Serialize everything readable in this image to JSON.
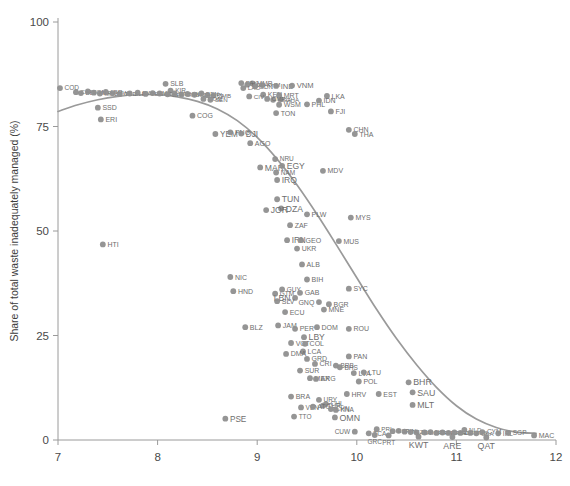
{
  "chart_data": {
    "type": "scatter",
    "title": "",
    "xlabel": "",
    "ylabel": "Share of total waste inadequately managed (%)",
    "xlim": [
      7,
      12
    ],
    "ylim": [
      0,
      100
    ],
    "xticks": [
      7,
      8,
      9,
      10,
      11,
      12
    ],
    "yticks": [
      0,
      25,
      50,
      75,
      100
    ],
    "xticklabels": [
      "7",
      "8",
      "9",
      "10",
      "11",
      "12"
    ],
    "yticklabels": [
      "0",
      "25",
      "50",
      "75",
      "100"
    ],
    "grid": false,
    "legend": null,
    "point_color": "#8f8f8f",
    "label_color": "#6e6e6e",
    "trendline": {
      "name": "fitted curve",
      "color": "#9a9a9a",
      "x": [
        7.0,
        7.2,
        7.4,
        7.6,
        7.8,
        8.0,
        8.2,
        8.4,
        8.6,
        8.8,
        9.0,
        9.2,
        9.4,
        9.6,
        9.8,
        10.0,
        10.2,
        10.4,
        10.6,
        10.8,
        11.0,
        11.2,
        11.4,
        11.6,
        11.8
      ],
      "y": [
        78.6,
        80.2,
        81.4,
        82.2,
        82.6,
        82.6,
        82.1,
        81.0,
        79.2,
        76.4,
        72.4,
        67.2,
        61.0,
        54.0,
        46.5,
        38.8,
        31.2,
        24.2,
        18.0,
        12.6,
        8.2,
        5.0,
        3.0,
        1.9,
        1.6
      ]
    },
    "points": [
      {
        "code": "COD",
        "x": 7.02,
        "y": 84.2,
        "lp": "r",
        "fs": 6.5
      },
      {
        "code": "CAF",
        "x": 7.18,
        "y": 83.2,
        "lp": "r",
        "fs": 6.2
      },
      {
        "code": "BDI",
        "x": 7.23,
        "y": 83.0,
        "lp": "r",
        "fs": 6.2
      },
      {
        "code": "SOM",
        "x": 7.3,
        "y": 83.4,
        "lp": "r",
        "fs": 6.2
      },
      {
        "code": "NER",
        "x": 7.36,
        "y": 83.1,
        "lp": "r",
        "fs": 6.2
      },
      {
        "code": "MOZ",
        "x": 7.42,
        "y": 82.9,
        "lp": "r",
        "fs": 6.2
      },
      {
        "code": "LBR",
        "x": 7.48,
        "y": 83.3,
        "lp": "r",
        "fs": 6.2
      },
      {
        "code": "MWI",
        "x": 7.55,
        "y": 83.0,
        "lp": "r",
        "fs": 6.2
      },
      {
        "code": "TCD",
        "x": 7.62,
        "y": 82.8,
        "lp": "r",
        "fs": 6.2
      },
      {
        "code": "SSD",
        "x": 7.4,
        "y": 79.5,
        "lp": "r",
        "fs": 7.0
      },
      {
        "code": "ERI",
        "x": 7.43,
        "y": 76.7,
        "lp": "r",
        "fs": 7.0
      },
      {
        "code": "HTI",
        "x": 7.45,
        "y": 46.8,
        "lp": "r",
        "fs": 7.0
      },
      {
        "code": "SLE",
        "x": 7.72,
        "y": 82.9,
        "lp": "r",
        "fs": 6.2
      },
      {
        "code": "RWA",
        "x": 7.8,
        "y": 83.1,
        "lp": "r",
        "fs": 6.2
      },
      {
        "code": "TGO",
        "x": 7.88,
        "y": 82.8,
        "lp": "r",
        "fs": 6.2
      },
      {
        "code": "GMB",
        "x": 7.95,
        "y": 83.0,
        "lp": "r",
        "fs": 6.2
      },
      {
        "code": "SLB",
        "x": 8.08,
        "y": 85.2,
        "lp": "r",
        "fs": 7.0
      },
      {
        "code": "KIR",
        "x": 8.13,
        "y": 83.6,
        "lp": "r",
        "fs": 6.5
      },
      {
        "code": "UGA",
        "x": 8.02,
        "y": 82.9,
        "lp": "r",
        "fs": 6.2
      },
      {
        "code": "BFA",
        "x": 8.1,
        "y": 82.7,
        "lp": "r",
        "fs": 6.2
      },
      {
        "code": "ETH",
        "x": 8.17,
        "y": 82.9,
        "lp": "r",
        "fs": 6.2
      },
      {
        "code": "GNB",
        "x": 8.24,
        "y": 82.7,
        "lp": "r",
        "fs": 6.2
      },
      {
        "code": "MLI",
        "x": 8.3,
        "y": 82.8,
        "lp": "r",
        "fs": 6.2
      },
      {
        "code": "TZA",
        "x": 8.37,
        "y": 82.6,
        "lp": "r",
        "fs": 6.2
      },
      {
        "code": "BEN",
        "x": 8.44,
        "y": 82.9,
        "lp": "r",
        "fs": 6.2
      },
      {
        "code": "NPL",
        "x": 8.5,
        "y": 82.5,
        "lp": "r",
        "fs": 6.2
      },
      {
        "code": "ZMB",
        "x": 8.56,
        "y": 82.4,
        "lp": "r",
        "fs": 6.2
      },
      {
        "code": "COM",
        "x": 8.46,
        "y": 81.6,
        "lp": "r",
        "fs": 6.2
      },
      {
        "code": "SEN",
        "x": 8.53,
        "y": 81.4,
        "lp": "r",
        "fs": 6.2
      },
      {
        "code": "COG",
        "x": 8.35,
        "y": 77.6,
        "lp": "r",
        "fs": 7.0
      },
      {
        "code": "YEM",
        "x": 8.58,
        "y": 73.2,
        "lp": "r",
        "fs": 8.2
      },
      {
        "code": "PNG",
        "x": 8.73,
        "y": 73.6,
        "lp": "r",
        "fs": 7.0
      },
      {
        "code": "DJI",
        "x": 8.84,
        "y": 73.3,
        "lp": "r",
        "fs": 8.2
      },
      {
        "code": "AGO",
        "x": 8.93,
        "y": 71.0,
        "lp": "r",
        "fs": 7.0
      },
      {
        "code": "PSE",
        "x": 8.68,
        "y": 5.1,
        "lp": "r",
        "fs": 8.2
      },
      {
        "code": "BLZ",
        "x": 8.88,
        "y": 27.0,
        "lp": "r",
        "fs": 7.0
      },
      {
        "code": "NIC",
        "x": 8.73,
        "y": 39.0,
        "lp": "r",
        "fs": 7.0
      },
      {
        "code": "HND",
        "x": 8.76,
        "y": 35.6,
        "lp": "r",
        "fs": 7.0
      },
      {
        "code": "MMR",
        "x": 8.95,
        "y": 85.3,
        "lp": "r",
        "fs": 6.5
      },
      {
        "code": "PAK",
        "x": 8.84,
        "y": 85.4,
        "lp": "r",
        "fs": 6.2
      },
      {
        "code": "BGD",
        "x": 8.9,
        "y": 85.0,
        "lp": "r",
        "fs": 6.2
      },
      {
        "code": "LAO",
        "x": 8.86,
        "y": 84.2,
        "lp": "r",
        "fs": 6.2
      },
      {
        "code": "SDN",
        "x": 8.98,
        "y": 84.6,
        "lp": "r",
        "fs": 6.2
      },
      {
        "code": "KHM",
        "x": 9.05,
        "y": 84.9,
        "lp": "r",
        "fs": 6.2
      },
      {
        "code": "IND",
        "x": 9.19,
        "y": 84.7,
        "lp": "r",
        "fs": 7.6
      },
      {
        "code": "VNM",
        "x": 9.35,
        "y": 84.8,
        "lp": "r",
        "fs": 7.6
      },
      {
        "code": "KEN",
        "x": 9.06,
        "y": 82.6,
        "lp": "r",
        "fs": 7.0
      },
      {
        "code": "MRT",
        "x": 9.22,
        "y": 82.5,
        "lp": "r",
        "fs": 7.0
      },
      {
        "code": "CIV",
        "x": 8.92,
        "y": 82.2,
        "lp": "r",
        "fs": 6.2
      },
      {
        "code": "NGA",
        "x": 9.16,
        "y": 81.4,
        "lp": "r",
        "fs": 6.2
      },
      {
        "code": "GHA",
        "x": 9.24,
        "y": 81.5,
        "lp": "r",
        "fs": 6.2
      },
      {
        "code": "CMR",
        "x": 9.1,
        "y": 81.6,
        "lp": "r",
        "fs": 6.2
      },
      {
        "code": "WSM",
        "x": 9.22,
        "y": 80.2,
        "lp": "r",
        "fs": 7.0
      },
      {
        "code": "TON",
        "x": 9.19,
        "y": 78.2,
        "lp": "r",
        "fs": 7.0
      },
      {
        "code": "PHL",
        "x": 9.5,
        "y": 80.3,
        "lp": "r",
        "fs": 7.0
      },
      {
        "code": "LKA",
        "x": 9.7,
        "y": 82.3,
        "lp": "r",
        "fs": 7.0
      },
      {
        "code": "IDN",
        "x": 9.62,
        "y": 81.2,
        "lp": "r",
        "fs": 7.0
      },
      {
        "code": "FJI",
        "x": 9.74,
        "y": 78.6,
        "lp": "r",
        "fs": 7.0
      },
      {
        "code": "CHN",
        "x": 9.92,
        "y": 74.2,
        "lp": "r",
        "fs": 7.0
      },
      {
        "code": "THA",
        "x": 9.98,
        "y": 73.2,
        "lp": "r",
        "fs": 7.0
      },
      {
        "code": "MAR",
        "x": 9.03,
        "y": 65.2,
        "lp": "r",
        "fs": 8.6
      },
      {
        "code": "NAM",
        "x": 9.19,
        "y": 64.0,
        "lp": "r",
        "fs": 6.5
      },
      {
        "code": "NRU",
        "x": 9.18,
        "y": 67.2,
        "lp": "r",
        "fs": 6.5
      },
      {
        "code": "EGY",
        "x": 9.25,
        "y": 65.6,
        "lp": "r",
        "fs": 8.6
      },
      {
        "code": "IRQ",
        "x": 9.2,
        "y": 62.2,
        "lp": "r",
        "fs": 8.6
      },
      {
        "code": "MDV",
        "x": 9.66,
        "y": 64.4,
        "lp": "r",
        "fs": 7.0
      },
      {
        "code": "TUN",
        "x": 9.2,
        "y": 57.6,
        "lp": "r",
        "fs": 8.6
      },
      {
        "code": "DZA",
        "x": 9.24,
        "y": 55.4,
        "lp": "r",
        "fs": 8.6
      },
      {
        "code": "JOR",
        "x": 9.09,
        "y": 55.0,
        "lp": "r",
        "fs": 8.6
      },
      {
        "code": "PLW",
        "x": 9.5,
        "y": 54.0,
        "lp": "r",
        "fs": 7.0
      },
      {
        "code": "MYS",
        "x": 9.94,
        "y": 53.2,
        "lp": "r",
        "fs": 7.0
      },
      {
        "code": "ZAF",
        "x": 9.33,
        "y": 51.4,
        "lp": "r",
        "fs": 7.0
      },
      {
        "code": "IRN",
        "x": 9.3,
        "y": 47.8,
        "lp": "r",
        "fs": 8.2
      },
      {
        "code": "GEO",
        "x": 9.44,
        "y": 47.8,
        "lp": "r",
        "fs": 7.0
      },
      {
        "code": "MUS",
        "x": 9.82,
        "y": 47.6,
        "lp": "r",
        "fs": 7.0
      },
      {
        "code": "UKR",
        "x": 9.4,
        "y": 45.8,
        "lp": "r",
        "fs": 7.0
      },
      {
        "code": "ALB",
        "x": 9.45,
        "y": 42.0,
        "lp": "r",
        "fs": 7.0
      },
      {
        "code": "BIH",
        "x": 9.5,
        "y": 38.4,
        "lp": "r",
        "fs": 7.0
      },
      {
        "code": "SYC",
        "x": 9.92,
        "y": 36.2,
        "lp": "r",
        "fs": 7.0
      },
      {
        "code": "GTM",
        "x": 9.18,
        "y": 35.0,
        "lp": "r",
        "fs": 6.5
      },
      {
        "code": "GUY",
        "x": 9.25,
        "y": 36.0,
        "lp": "r",
        "fs": 6.5
      },
      {
        "code": "GAB",
        "x": 9.43,
        "y": 35.2,
        "lp": "r",
        "fs": 7.0
      },
      {
        "code": "LBN",
        "x": 9.38,
        "y": 34.0,
        "lp": "l",
        "fs": 8.6
      },
      {
        "code": "SLV",
        "x": 9.2,
        "y": 33.2,
        "lp": "r",
        "fs": 7.0
      },
      {
        "code": "GNQ",
        "x": 9.62,
        "y": 33.0,
        "lp": "l",
        "fs": 7.0
      },
      {
        "code": "BGR",
        "x": 9.72,
        "y": 32.5,
        "lp": "r",
        "fs": 7.0
      },
      {
        "code": "MNE",
        "x": 9.67,
        "y": 31.2,
        "lp": "r",
        "fs": 7.0
      },
      {
        "code": "ECU",
        "x": 9.28,
        "y": 30.6,
        "lp": "r",
        "fs": 7.0
      },
      {
        "code": "JAM",
        "x": 9.21,
        "y": 27.4,
        "lp": "r",
        "fs": 7.0
      },
      {
        "code": "PER",
        "x": 9.38,
        "y": 26.6,
        "lp": "r",
        "fs": 7.0
      },
      {
        "code": "DOM",
        "x": 9.6,
        "y": 27.0,
        "lp": "r",
        "fs": 7.0
      },
      {
        "code": "ROU",
        "x": 9.92,
        "y": 26.6,
        "lp": "r",
        "fs": 7.0
      },
      {
        "code": "LBY",
        "x": 9.47,
        "y": 24.6,
        "lp": "r",
        "fs": 8.6
      },
      {
        "code": "VCT",
        "x": 9.34,
        "y": 23.2,
        "lp": "r",
        "fs": 7.0
      },
      {
        "code": "COL",
        "x": 9.48,
        "y": 23.0,
        "lp": "r",
        "fs": 7.0
      },
      {
        "code": "LCA",
        "x": 9.46,
        "y": 21.2,
        "lp": "r",
        "fs": 7.0
      },
      {
        "code": "DMA",
        "x": 9.29,
        "y": 20.6,
        "lp": "r",
        "fs": 7.0
      },
      {
        "code": "GRD",
        "x": 9.5,
        "y": 19.4,
        "lp": "r",
        "fs": 7.0
      },
      {
        "code": "CRI",
        "x": 9.58,
        "y": 18.2,
        "lp": "r",
        "fs": 7.0
      },
      {
        "code": "PAN",
        "x": 9.92,
        "y": 20.0,
        "lp": "r",
        "fs": 7.0
      },
      {
        "code": "BRB",
        "x": 9.79,
        "y": 17.8,
        "lp": "r",
        "fs": 6.5
      },
      {
        "code": "BHS",
        "x": 9.83,
        "y": 17.4,
        "lp": "r",
        "fs": 6.5
      },
      {
        "code": "SUR",
        "x": 9.43,
        "y": 16.6,
        "lp": "r",
        "fs": 7.0
      },
      {
        "code": "LVA",
        "x": 9.97,
        "y": 16.0,
        "lp": "r",
        "fs": 7.0
      },
      {
        "code": "LTU",
        "x": 10.07,
        "y": 16.2,
        "lp": "r",
        "fs": 7.0
      },
      {
        "code": "MEX",
        "x": 9.53,
        "y": 14.8,
        "lp": "r",
        "fs": 7.0
      },
      {
        "code": "ARG",
        "x": 9.59,
        "y": 14.6,
        "lp": "r",
        "fs": 7.0
      },
      {
        "code": "POL",
        "x": 10.02,
        "y": 14.0,
        "lp": "r",
        "fs": 7.0
      },
      {
        "code": "BHR",
        "x": 10.52,
        "y": 13.8,
        "lp": "r",
        "fs": 8.8
      },
      {
        "code": "SAU",
        "x": 10.56,
        "y": 11.4,
        "lp": "r",
        "fs": 8.8
      },
      {
        "code": "MLT",
        "x": 10.56,
        "y": 8.4,
        "lp": "r",
        "fs": 8.8
      },
      {
        "code": "BRA",
        "x": 9.34,
        "y": 10.4,
        "lp": "r",
        "fs": 7.0
      },
      {
        "code": "URY",
        "x": 9.62,
        "y": 9.6,
        "lp": "r",
        "fs": 6.5
      },
      {
        "code": "HRV",
        "x": 9.9,
        "y": 11.0,
        "lp": "r",
        "fs": 7.0
      },
      {
        "code": "EST",
        "x": 10.22,
        "y": 11.0,
        "lp": "r",
        "fs": 7.0
      },
      {
        "code": "CHL",
        "x": 9.69,
        "y": 8.6,
        "lp": "r",
        "fs": 6.5
      },
      {
        "code": "TUR",
        "x": 9.66,
        "y": 8.2,
        "lp": "r",
        "fs": 6.5
      },
      {
        "code": "VEN",
        "x": 9.44,
        "y": 7.8,
        "lp": "r",
        "fs": 6.5
      },
      {
        "code": "ATG",
        "x": 9.56,
        "y": 8.0,
        "lp": "r",
        "fs": 6.5
      },
      {
        "code": "CHN2",
        "x": 9.74,
        "y": 7.4,
        "lp": "r",
        "fs": 6.5
      },
      {
        "code": "KNA",
        "x": 9.79,
        "y": 7.2,
        "lp": "r",
        "fs": 6.5
      },
      {
        "code": "TTO",
        "x": 9.37,
        "y": 5.6,
        "lp": "r",
        "fs": 6.5
      },
      {
        "code": "OMN",
        "x": 9.78,
        "y": 5.4,
        "lp": "r",
        "fs": 8.8
      },
      {
        "code": "CUW",
        "x": 9.98,
        "y": 2.0,
        "lp": "l",
        "fs": 6.5
      },
      {
        "code": "TCA",
        "x": 10.12,
        "y": 1.6,
        "lp": "r",
        "fs": 6.5
      },
      {
        "code": "PRI",
        "x": 10.2,
        "y": 2.6,
        "lp": "r",
        "fs": 6.2
      },
      {
        "code": "GRC",
        "x": 10.18,
        "y": 1.2,
        "lp": "b",
        "fs": 6.5
      },
      {
        "code": "PRT",
        "x": 10.32,
        "y": 1.1,
        "lp": "b",
        "fs": 6.5
      },
      {
        "code": "ESP",
        "x": 10.36,
        "y": 2.1,
        "lp": "r",
        "fs": 6.2
      },
      {
        "code": "SVN",
        "x": 10.42,
        "y": 2.2,
        "lp": "r",
        "fs": 6.2
      },
      {
        "code": "ITA",
        "x": 10.48,
        "y": 2.0,
        "lp": "r",
        "fs": 6.2
      },
      {
        "code": "CZE",
        "x": 10.54,
        "y": 1.9,
        "lp": "r",
        "fs": 6.2
      },
      {
        "code": "ISR",
        "x": 10.6,
        "y": 1.8,
        "lp": "r",
        "fs": 6.2
      },
      {
        "code": "KWT",
        "x": 10.62,
        "y": 0.8,
        "lp": "b",
        "fs": 8.8
      },
      {
        "code": "KOR",
        "x": 10.68,
        "y": 1.8,
        "lp": "r",
        "fs": 6.2
      },
      {
        "code": "NZL",
        "x": 10.74,
        "y": 1.9,
        "lp": "r",
        "fs": 6.2
      },
      {
        "code": "JPN",
        "x": 10.8,
        "y": 1.7,
        "lp": "r",
        "fs": 6.2
      },
      {
        "code": "FRA",
        "x": 10.86,
        "y": 1.8,
        "lp": "r",
        "fs": 6.2
      },
      {
        "code": "GBR",
        "x": 10.92,
        "y": 1.7,
        "lp": "r",
        "fs": 6.2
      },
      {
        "code": "BEL",
        "x": 10.98,
        "y": 1.8,
        "lp": "r",
        "fs": 6.2
      },
      {
        "code": "DEU",
        "x": 11.04,
        "y": 1.7,
        "lp": "r",
        "fs": 6.2
      },
      {
        "code": "ARE",
        "x": 10.96,
        "y": 0.7,
        "lp": "b",
        "fs": 8.8
      },
      {
        "code": "NLD",
        "x": 11.08,
        "y": 2.4,
        "lp": "r",
        "fs": 6.2
      },
      {
        "code": "AUS",
        "x": 11.14,
        "y": 1.7,
        "lp": "r",
        "fs": 6.2
      },
      {
        "code": "USA",
        "x": 11.2,
        "y": 1.6,
        "lp": "r",
        "fs": 6.2
      },
      {
        "code": "CYM",
        "x": 11.26,
        "y": 1.9,
        "lp": "r",
        "fs": 6.5
      },
      {
        "code": "QAT",
        "x": 11.3,
        "y": 0.6,
        "lp": "b",
        "fs": 8.8
      },
      {
        "code": "IRL",
        "x": 11.42,
        "y": 1.6,
        "lp": "r",
        "fs": 6.5
      },
      {
        "code": "SGP",
        "x": 11.52,
        "y": 1.7,
        "lp": "r",
        "fs": 6.5
      },
      {
        "code": "MAC",
        "x": 11.78,
        "y": 1.1,
        "lp": "r",
        "fs": 7.0
      }
    ]
  }
}
